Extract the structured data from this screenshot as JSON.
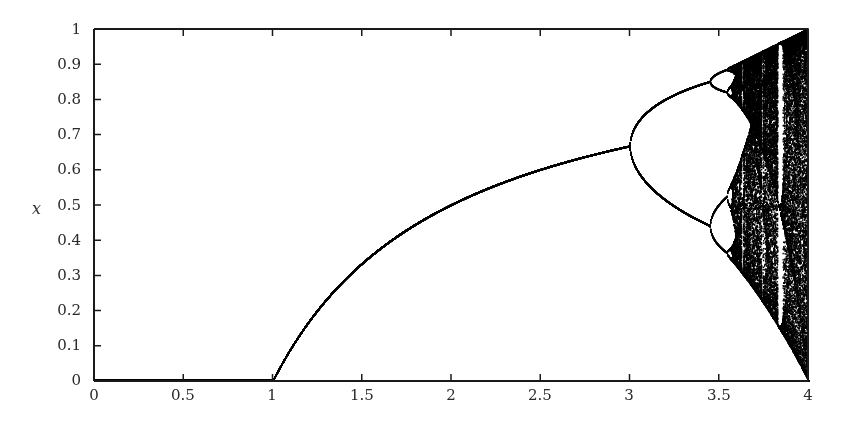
{
  "chart_data": {
    "type": "scatter",
    "title": "",
    "subtitle": "",
    "xlabel": "",
    "ylabel": "x",
    "xlim": [
      0,
      4
    ],
    "ylim": [
      0,
      1
    ],
    "x_ticks": [
      0,
      0.5,
      1,
      1.5,
      2,
      2.5,
      3,
      3.5,
      4
    ],
    "x_tick_labels": [
      "0",
      "0.5",
      "1",
      "1.5",
      "2",
      "2.5",
      "3",
      "3.5",
      "4"
    ],
    "y_ticks": [
      0,
      0.1,
      0.2,
      0.3,
      0.4,
      0.5,
      0.6,
      0.7,
      0.8,
      0.9,
      1
    ],
    "y_tick_labels": [
      "0",
      "0.1",
      "0.2",
      "0.3",
      "0.4",
      "0.5",
      "0.6",
      "0.7",
      "0.8",
      "0.9",
      "1"
    ],
    "grid": false,
    "legend": null,
    "map": {
      "equation": "x_next = r * x * (1 - x)",
      "r_range": [
        0,
        4
      ],
      "x0": 0.5,
      "transient_iterations": 600,
      "plotted_iterations": 220
    },
    "key_points": [
      {
        "r": 1.0,
        "x": 0.0,
        "note": "fixed point leaves zero"
      },
      {
        "r": 2.0,
        "x": 0.5
      },
      {
        "r": 3.0,
        "x": 0.667,
        "note": "period-2 bifurcation"
      },
      {
        "r": 3.449,
        "x": [
          0.44,
          0.85
        ],
        "note": "period-4 bifurcation"
      },
      {
        "r": 3.57,
        "x": null,
        "note": "onset of chaos"
      },
      {
        "r": 3.83,
        "x": [
          0.16,
          0.5,
          0.96
        ],
        "note": "period-3 window"
      },
      {
        "r": 4.0,
        "x": [
          0,
          1
        ],
        "note": "full chaotic band"
      }
    ],
    "colors": {
      "points": "#000000",
      "background": "#ffffff",
      "axes": "#1a1a1a"
    }
  }
}
